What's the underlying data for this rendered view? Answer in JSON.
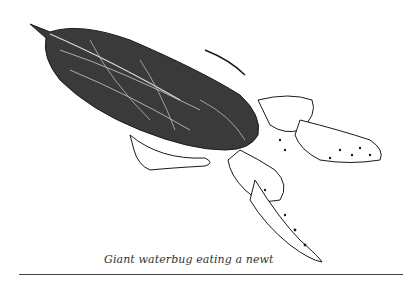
{
  "figure": {
    "caption": "Giant waterbug eating a newt",
    "subjects": [
      "giant waterbug",
      "newt"
    ],
    "colors": {
      "ink": "#1a1a1a",
      "paper": "#ffffff",
      "rule": "#444444"
    }
  }
}
